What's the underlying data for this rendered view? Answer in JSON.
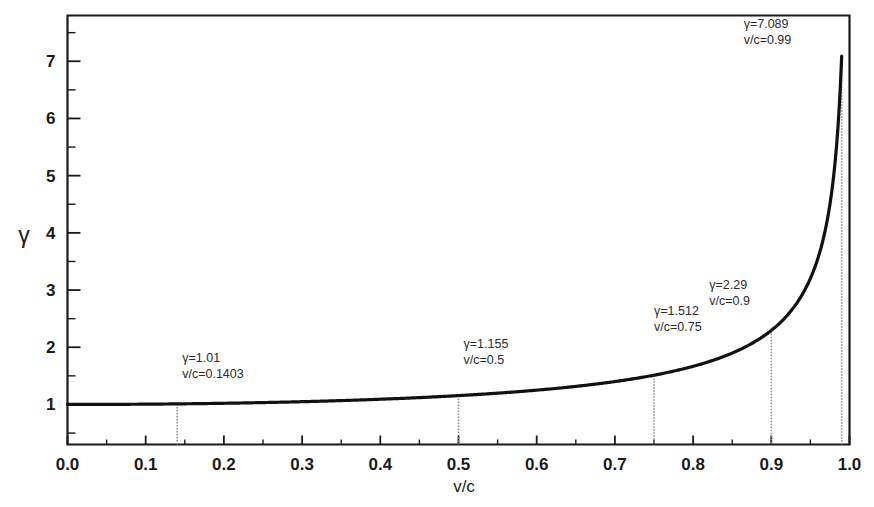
{
  "chart_data": {
    "type": "line",
    "title": "",
    "subtitle": "",
    "xlabel": "v/c",
    "ylabel": "γ",
    "xlim": [
      0.0,
      1.0
    ],
    "ylim": [
      0.3,
      7.8
    ],
    "grid": false,
    "legend": null,
    "curve_formula": "gamma = 1 / sqrt(1 - (v/c)^2)",
    "xticks": [
      "0.0",
      "0.1",
      "0.2",
      "0.3",
      "0.4",
      "0.5",
      "0.6",
      "0.7",
      "0.8",
      "0.9",
      "1.0"
    ],
    "xtick_values": [
      0.0,
      0.1,
      0.2,
      0.3,
      0.4,
      0.5,
      0.6,
      0.7,
      0.8,
      0.9,
      1.0
    ],
    "xminor_step": 0.05,
    "yticks": [
      "1",
      "2",
      "3",
      "4",
      "5",
      "6",
      "7"
    ],
    "ytick_values": [
      1,
      2,
      3,
      4,
      5,
      6,
      7
    ],
    "yminor_step": 0.5,
    "series": [
      {
        "name": "Lorentz factor",
        "x": [
          0.0,
          0.05,
          0.1,
          0.1403,
          0.15,
          0.2,
          0.25,
          0.3,
          0.35,
          0.4,
          0.45,
          0.5,
          0.55,
          0.6,
          0.65,
          0.7,
          0.75,
          0.8,
          0.82,
          0.84,
          0.86,
          0.88,
          0.9,
          0.91,
          0.92,
          0.93,
          0.94,
          0.95,
          0.96,
          0.965,
          0.97,
          0.975,
          0.98,
          0.983,
          0.986,
          0.988,
          0.99
        ],
        "y": [
          1.0,
          1.001,
          1.005,
          1.01,
          1.011,
          1.021,
          1.033,
          1.048,
          1.068,
          1.091,
          1.12,
          1.155,
          1.197,
          1.25,
          1.316,
          1.4,
          1.512,
          1.667,
          1.747,
          1.845,
          1.96,
          2.105,
          2.294,
          2.41,
          2.552,
          2.72,
          2.931,
          3.203,
          3.571,
          3.805,
          4.113,
          4.501,
          5.025,
          5.455,
          6.014,
          6.482,
          7.089
        ]
      }
    ],
    "annotations": [
      {
        "id": "annot-1403",
        "gamma_label": "γ=1.01",
        "vc_label": "v/c=0.1403",
        "x": 0.1403,
        "y": 1.01
      },
      {
        "id": "annot-05",
        "gamma_label": "γ=1.155",
        "vc_label": "v/c=0.5",
        "x": 0.5,
        "y": 1.155
      },
      {
        "id": "annot-075",
        "gamma_label": "γ=1.512",
        "vc_label": "v/c=0.75",
        "x": 0.75,
        "y": 1.512
      },
      {
        "id": "annot-09",
        "gamma_label": "γ=2.29",
        "vc_label": "v/c=0.9",
        "x": 0.9,
        "y": 2.29
      },
      {
        "id": "annot-099",
        "gamma_label": "γ=7.089",
        "vc_label": "v/c=0.99",
        "x": 0.99,
        "y": 7.089
      }
    ],
    "colors": {
      "curve": "#111111",
      "axis": "#1a1a1a",
      "dropline": "#8a8a8a",
      "background": "#ffffff",
      "text": "#1a1a1a"
    }
  }
}
